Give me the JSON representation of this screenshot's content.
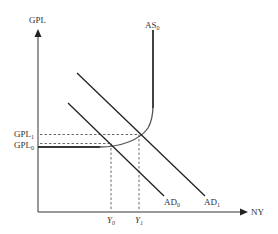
{
  "diagram": {
    "type": "AD-AS macroeconomic diagram",
    "axes": {
      "y_label": "GPL",
      "x_label": "NY"
    },
    "curves": {
      "as": {
        "base": "AS",
        "sub": "0"
      },
      "ad0": {
        "base": "AD",
        "sub": "0"
      },
      "ad1": {
        "base": "AD",
        "sub": "1"
      }
    },
    "y_ticks": {
      "gpl1": {
        "base": "GPL",
        "sub": "1"
      },
      "gpl0": {
        "base": "GPL",
        "sub": "0"
      }
    },
    "x_ticks": {
      "y0": {
        "base": "Y",
        "sub": "0"
      },
      "y1": {
        "base": "Y",
        "sub": "1"
      }
    },
    "colors": {
      "lines": "#222222",
      "curve": "#555555",
      "dashed": "#444444",
      "text": "#333333"
    }
  }
}
